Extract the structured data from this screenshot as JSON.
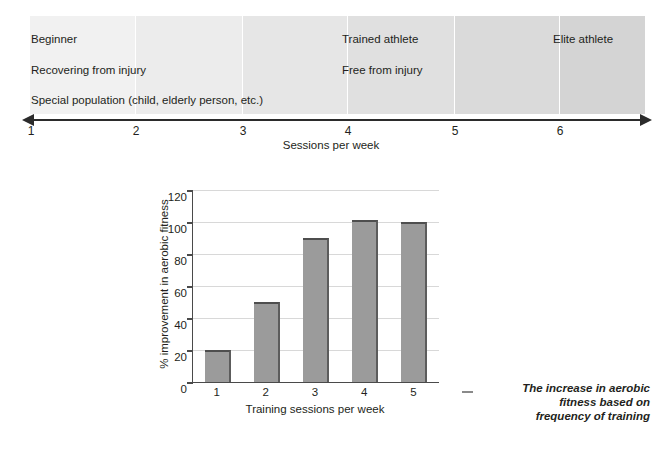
{
  "continuum": {
    "axis_title": "Sessions per week",
    "tick_labels": [
      "1",
      "2",
      "3",
      "4",
      "5",
      "6"
    ],
    "bands": [
      {
        "shade": "#f1f1f1"
      },
      {
        "shade": "#ececec"
      },
      {
        "shade": "#e6e6e6"
      },
      {
        "shade": "#e0e0e0"
      },
      {
        "shade": "#dadada"
      },
      {
        "shade": "#d4d4d4"
      }
    ],
    "labels": [
      {
        "text": "Beginner"
      },
      {
        "text": "Recovering from injury"
      },
      {
        "text": "Special population (child, elderly person, etc.)"
      },
      {
        "text": "Trained athlete"
      },
      {
        "text": "Free from injury"
      },
      {
        "text": "Elite athlete"
      }
    ]
  },
  "chart_data": {
    "type": "bar",
    "title": "",
    "categories": [
      "1",
      "2",
      "3",
      "4",
      "5"
    ],
    "values": [
      20,
      50,
      90,
      101,
      100
    ],
    "xlabel": "Training sessions per week",
    "ylabel": "% improvement in aerobic fitness",
    "ylim": [
      0,
      120
    ],
    "yticks": [
      0,
      20,
      40,
      60,
      80,
      100,
      120
    ],
    "ytick_labels": [
      "0",
      "20",
      "40",
      "60",
      "80",
      "100",
      "120"
    ],
    "grid": true,
    "legend": "none",
    "bar_color": "#9b9b9b"
  },
  "caption": {
    "line1": "The increase in aerobic",
    "line2": "fitness based on",
    "line3": "frequency of training"
  }
}
